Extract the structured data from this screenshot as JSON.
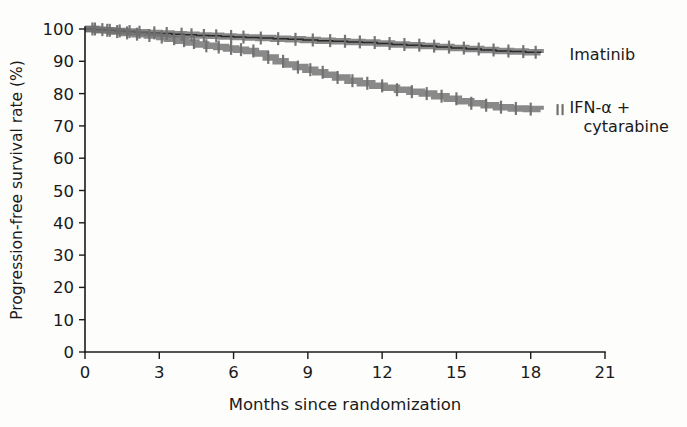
{
  "chart_data": {
    "type": "line",
    "title": "",
    "subtitle": "",
    "xlabel": "Months since randomization",
    "ylabel": "Progression-free survival rate (%)",
    "xlim": [
      0,
      21
    ],
    "ylim": [
      0,
      100
    ],
    "xticks": [
      0,
      3,
      6,
      9,
      12,
      15,
      18,
      21
    ],
    "xtick_labels": [
      "0",
      "3",
      "6",
      "9",
      "12",
      "15",
      "18",
      "21"
    ],
    "yticks": [
      0,
      10,
      20,
      30,
      40,
      50,
      60,
      70,
      80,
      90,
      100
    ],
    "ytick_labels": [
      "0",
      "10",
      "20",
      "30",
      "40",
      "50",
      "60",
      "70",
      "80",
      "90",
      "100"
    ],
    "grid": false,
    "legend_position": "right-inline",
    "plot_kind": "kaplan-meier-step",
    "series": [
      {
        "name": "Imatinib",
        "color": "#6f6f6f",
        "label_x": 18.6,
        "label_y": 92.0,
        "x": [
          0,
          0.4,
          0.8,
          1.2,
          1.6,
          2.0,
          2.5,
          3.0,
          3.5,
          4.0,
          4.5,
          5.0,
          5.5,
          6.0,
          6.5,
          7.0,
          7.6,
          8.2,
          8.8,
          9.4,
          10.0,
          10.6,
          11.2,
          11.8,
          12.4,
          13.0,
          13.6,
          14.2,
          14.8,
          15.4,
          16.0,
          16.6,
          17.2,
          17.8,
          18.4
        ],
        "y": [
          100.0,
          99.8,
          99.6,
          99.4,
          99.2,
          99.0,
          98.8,
          98.6,
          98.4,
          98.2,
          98.0,
          97.9,
          97.7,
          97.5,
          97.4,
          97.2,
          97.0,
          96.8,
          96.6,
          96.4,
          96.2,
          96.0,
          95.8,
          95.5,
          95.2,
          95.0,
          94.7,
          94.4,
          94.1,
          93.8,
          93.5,
          93.2,
          93.0,
          92.8,
          92.6
        ],
        "censor_x": [
          0.3,
          0.7,
          1.0,
          1.4,
          1.8,
          2.2,
          2.8,
          3.3,
          3.9,
          4.3,
          4.8,
          5.3,
          5.9,
          6.4,
          7.1,
          7.8,
          8.5,
          9.2,
          9.9,
          10.5,
          11.1,
          11.7,
          12.3,
          12.9,
          13.5,
          14.1,
          14.7,
          15.3,
          15.9,
          16.5,
          17.1,
          17.7,
          18.2
        ]
      },
      {
        "name": "IFN-α + cytarabine",
        "color": "#6f6f6f",
        "label_x": 18.6,
        "label_y": 75.5,
        "label_line2": "cytarabine",
        "x": [
          0,
          0.5,
          1.0,
          1.5,
          2.0,
          2.5,
          3.0,
          3.3,
          3.7,
          4.1,
          4.5,
          4.9,
          5.3,
          5.7,
          6.1,
          6.5,
          6.9,
          7.3,
          7.7,
          8.1,
          8.5,
          8.9,
          9.3,
          9.7,
          10.1,
          10.6,
          11.1,
          11.6,
          12.1,
          12.6,
          13.1,
          13.6,
          14.1,
          14.6,
          15.1,
          15.6,
          16.1,
          16.6,
          17.2,
          17.8,
          18.4
        ],
        "y": [
          100.0,
          99.6,
          99.2,
          98.8,
          98.4,
          98.0,
          97.5,
          97.0,
          96.4,
          95.8,
          95.2,
          94.8,
          94.4,
          94.0,
          93.6,
          93.2,
          92.4,
          91.2,
          90.0,
          89.0,
          88.2,
          87.4,
          86.6,
          85.8,
          85.0,
          84.0,
          83.2,
          82.4,
          81.8,
          81.2,
          80.6,
          80.0,
          79.2,
          78.4,
          77.6,
          77.0,
          76.4,
          75.8,
          75.4,
          75.2,
          75.0
        ],
        "censor_x": [
          0.4,
          0.9,
          1.3,
          1.7,
          2.1,
          2.6,
          3.1,
          3.6,
          4.0,
          4.4,
          4.9,
          5.4,
          5.9,
          6.3,
          6.8,
          7.4,
          8.0,
          8.6,
          9.1,
          9.6,
          10.2,
          10.8,
          11.4,
          12.0,
          12.6,
          13.2,
          13.8,
          14.4,
          15.0,
          15.6,
          16.2,
          16.8,
          17.4,
          18.0
        ]
      }
    ]
  },
  "legend": {
    "items": [
      {
        "label": "Imatinib",
        "label2": ""
      },
      {
        "label": "IFN-α +",
        "label2": "cytarabine"
      }
    ],
    "censor_glyph": "censor-tick-icon"
  }
}
